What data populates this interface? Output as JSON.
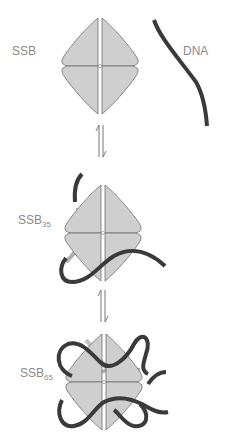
{
  "diagram": {
    "colors": {
      "protein_fill": "#cfcfcf",
      "protein_stroke": "#6e6e6e",
      "dna": "#3a3a3a",
      "dna_behind": "#9a9a9a",
      "label": "#8a8a8a",
      "arrow": "#777777"
    },
    "states": [
      {
        "label": "SSB",
        "subscript": "",
        "description": "Free SSB tetramer"
      },
      {
        "label": "SSB",
        "subscript": "35",
        "description": "SSB35 binding mode: ssDNA wraps around two subunits"
      },
      {
        "label": "SSB",
        "subscript": "65",
        "description": "SSB65 binding mode: ssDNA wraps around all four subunits"
      }
    ],
    "dna_label": "DNA",
    "equilibrium_arrows": [
      {
        "between": [
          "SSB + DNA",
          "SSB35"
        ],
        "symbol": "⇌"
      },
      {
        "between": [
          "SSB35",
          "SSB65"
        ],
        "symbol": "⇌"
      }
    ]
  }
}
